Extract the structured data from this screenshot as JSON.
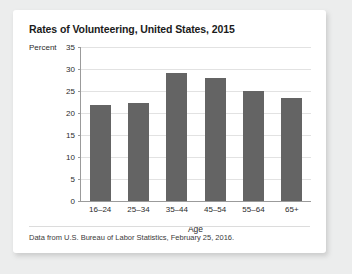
{
  "card": {
    "background": "#ffffff",
    "page_background": "#eceded"
  },
  "chart_data": {
    "type": "bar",
    "title": "Rates of Volunteering, United States, 2015",
    "categories": [
      "16–24",
      "25–34",
      "35–44",
      "45–54",
      "55–64",
      "65+"
    ],
    "values": [
      21.8,
      22.3,
      29.0,
      28.0,
      25.0,
      23.5
    ],
    "xlabel": "Age",
    "ylabel": "Percent",
    "ylim": [
      0,
      35
    ],
    "yticks": [
      0,
      5,
      10,
      15,
      20,
      25,
      30,
      35
    ],
    "ytick_labels": [
      "0",
      "5",
      "10",
      "15",
      "20",
      "25",
      "30",
      "35"
    ],
    "grid": true,
    "legend": false,
    "bar_color": "#646464",
    "gridline_color": "#e2e2e2",
    "axis_color": "#9b9b9b"
  },
  "source": {
    "note": "Data from U.S. Bureau of Labor Statistics, February 25, 2016."
  }
}
